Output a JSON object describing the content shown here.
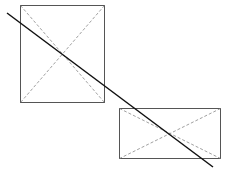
{
  "diagram": {
    "colors": {
      "rect_stroke": "#555555",
      "diagonal_stroke": "#888888",
      "line_stroke": "#111111",
      "background": "#ffffff"
    },
    "shapes": [
      {
        "kind": "rectangle",
        "name": "rect-1",
        "diagonals": "dashed"
      },
      {
        "kind": "rectangle",
        "name": "rect-2",
        "diagonals": "dashed"
      },
      {
        "kind": "line",
        "name": "intersecting-line",
        "style": "solid"
      }
    ]
  }
}
